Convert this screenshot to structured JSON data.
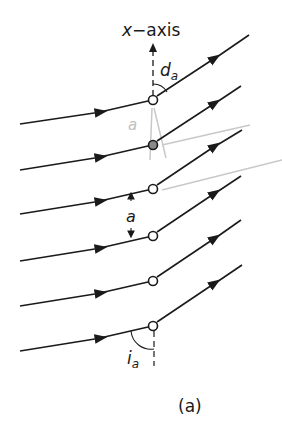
{
  "diagram": {
    "axis_label": "x−axis",
    "deflection_angle_label": "d",
    "deflection_angle_sub": "a",
    "incidence_angle_label": "i",
    "incidence_angle_sub": "a",
    "spacing_label": "a",
    "faint_label": "a",
    "caption": "(a)",
    "atom_count": 6,
    "colors": {
      "line": "#1a1a1a",
      "faint": "#bdbdbd",
      "background": "#ffffff"
    }
  }
}
